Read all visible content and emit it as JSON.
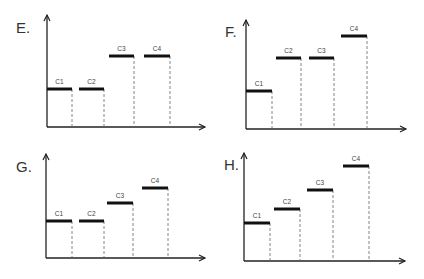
{
  "figure": {
    "width": 424,
    "height": 279,
    "colors": {
      "line": "#111111",
      "axis": "#222222",
      "dash": "#666666",
      "text": "#333333"
    }
  },
  "chart_data": [
    {
      "type": "bar",
      "title": "E.",
      "categories": [
        "C1",
        "C2",
        "C3",
        "C4"
      ],
      "values": [
        1,
        1,
        2,
        2
      ],
      "xlabel": "",
      "ylabel": "",
      "geometry": {
        "origin": [
          47,
          127
        ],
        "y_top": 15,
        "x_end": 205,
        "letter_pos": [
          16,
          33
        ],
        "bars": [
          {
            "label": "C1",
            "x1": 47,
            "x2": 72,
            "y": 89
          },
          {
            "label": "C2",
            "x1": 79,
            "x2": 104,
            "y": 89
          },
          {
            "label": "C3",
            "x1": 109,
            "x2": 134,
            "y": 56
          },
          {
            "label": "C4",
            "x1": 144,
            "x2": 170,
            "y": 56
          }
        ]
      }
    },
    {
      "type": "bar",
      "title": "F.",
      "categories": [
        "C1",
        "C2",
        "C3",
        "C4"
      ],
      "values": [
        1,
        2,
        2,
        3
      ],
      "xlabel": "",
      "ylabel": "",
      "geometry": {
        "origin": [
          246,
          129
        ],
        "y_top": 20,
        "x_end": 406,
        "letter_pos": [
          225,
          37
        ],
        "bars": [
          {
            "label": "C1",
            "x1": 246,
            "x2": 272,
            "y": 91
          },
          {
            "label": "C2",
            "x1": 276,
            "x2": 301,
            "y": 58
          },
          {
            "label": "C3",
            "x1": 309,
            "x2": 334,
            "y": 58
          },
          {
            "label": "C4",
            "x1": 341,
            "x2": 367,
            "y": 36
          }
        ]
      }
    },
    {
      "type": "bar",
      "title": "G.",
      "categories": [
        "C1",
        "C2",
        "C3",
        "C4"
      ],
      "values": [
        1,
        1,
        2,
        3
      ],
      "xlabel": "",
      "ylabel": "",
      "geometry": {
        "origin": [
          46,
          258
        ],
        "y_top": 154,
        "x_end": 205,
        "letter_pos": [
          16,
          172
        ],
        "bars": [
          {
            "label": "C1",
            "x1": 46,
            "x2": 72,
            "y": 221
          },
          {
            "label": "C2",
            "x1": 79,
            "x2": 104,
            "y": 221
          },
          {
            "label": "C3",
            "x1": 107,
            "x2": 133,
            "y": 203
          },
          {
            "label": "C4",
            "x1": 142,
            "x2": 168,
            "y": 188
          }
        ]
      }
    },
    {
      "type": "bar",
      "title": "H.",
      "categories": [
        "C1",
        "C2",
        "C3",
        "C4"
      ],
      "values": [
        1,
        2,
        3,
        4
      ],
      "xlabel": "",
      "ylabel": "",
      "geometry": {
        "origin": [
          244,
          261
        ],
        "y_top": 153,
        "x_end": 405,
        "letter_pos": [
          224,
          170
        ],
        "bars": [
          {
            "label": "C1",
            "x1": 244,
            "x2": 270,
            "y": 223
          },
          {
            "label": "C2",
            "x1": 274,
            "x2": 300,
            "y": 209
          },
          {
            "label": "C3",
            "x1": 307,
            "x2": 333,
            "y": 190
          },
          {
            "label": "C4",
            "x1": 343,
            "x2": 369,
            "y": 166
          }
        ]
      }
    }
  ]
}
